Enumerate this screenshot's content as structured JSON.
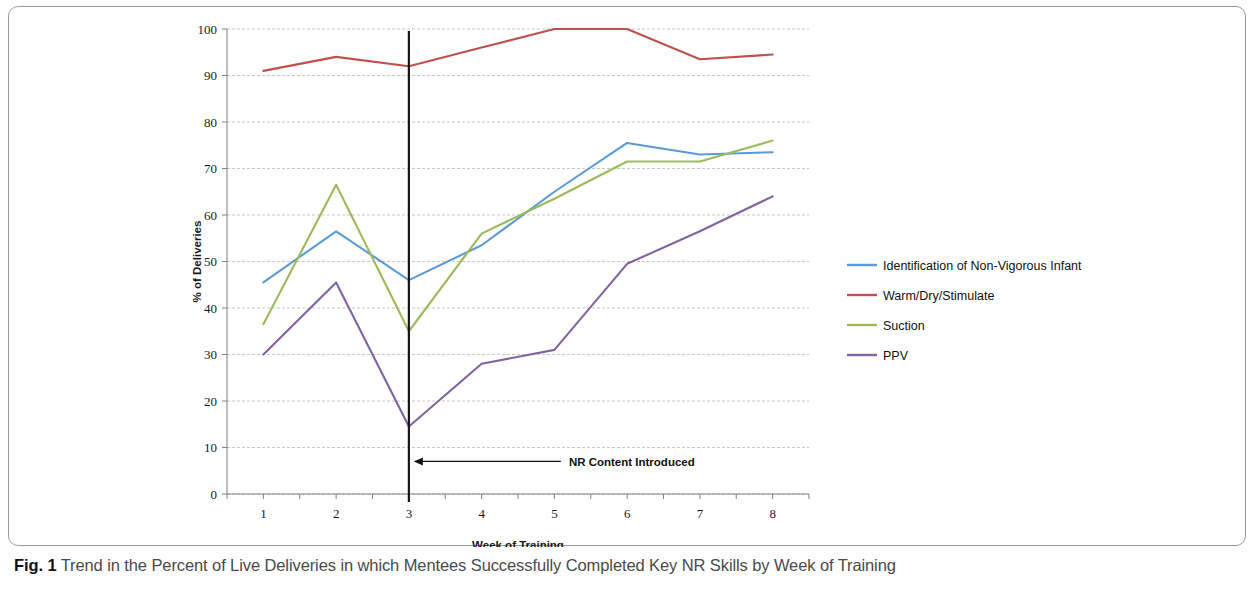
{
  "figure": {
    "caption_label": "Fig. 1",
    "caption_text": "Trend in the Percent of Live Deliveries in which Mentees Successfully Completed Key NR Skills by Week of Training"
  },
  "chart_data": {
    "type": "line",
    "title": "",
    "xlabel": "Week of Training",
    "ylabel": "% of Deliveries",
    "categories": [
      "1",
      "2",
      "3",
      "4",
      "5",
      "6",
      "7",
      "8"
    ],
    "x": [
      1,
      2,
      3,
      4,
      5,
      6,
      7,
      8
    ],
    "xlim": [
      0.5,
      8.5
    ],
    "ylim": [
      0,
      100
    ],
    "ytick_labels": [
      "0",
      "10",
      "20",
      "30",
      "40",
      "50",
      "60",
      "70",
      "80",
      "90",
      "100"
    ],
    "yticks": [
      0,
      10,
      20,
      30,
      40,
      50,
      60,
      70,
      80,
      90,
      100
    ],
    "grid": true,
    "legend_position": "right",
    "series": [
      {
        "name": "Identification of Non-Vigorous Infant",
        "color": "#5b9bd5",
        "values": [
          45.5,
          56.5,
          46.0,
          53.5,
          65.0,
          75.5,
          73.0,
          73.5
        ]
      },
      {
        "name": "Warm/Dry/Stimulate",
        "color": "#c0504d",
        "values": [
          91.0,
          94.0,
          92.0,
          96.0,
          100.0,
          100.0,
          93.5,
          94.5
        ]
      },
      {
        "name": "Suction",
        "color": "#9bbb59",
        "values": [
          36.5,
          66.5,
          35.0,
          56.0,
          63.5,
          71.5,
          71.5,
          76.0
        ]
      },
      {
        "name": "PPV",
        "color": "#8064a2",
        "values": [
          30.0,
          45.5,
          14.5,
          28.0,
          31.0,
          49.5,
          56.5,
          64.0
        ]
      }
    ],
    "annotations": [
      {
        "text": "NR Content Introduced",
        "x": 3,
        "y": 7,
        "marker_line_x": 3,
        "marker_line_color": "#141414"
      }
    ]
  }
}
